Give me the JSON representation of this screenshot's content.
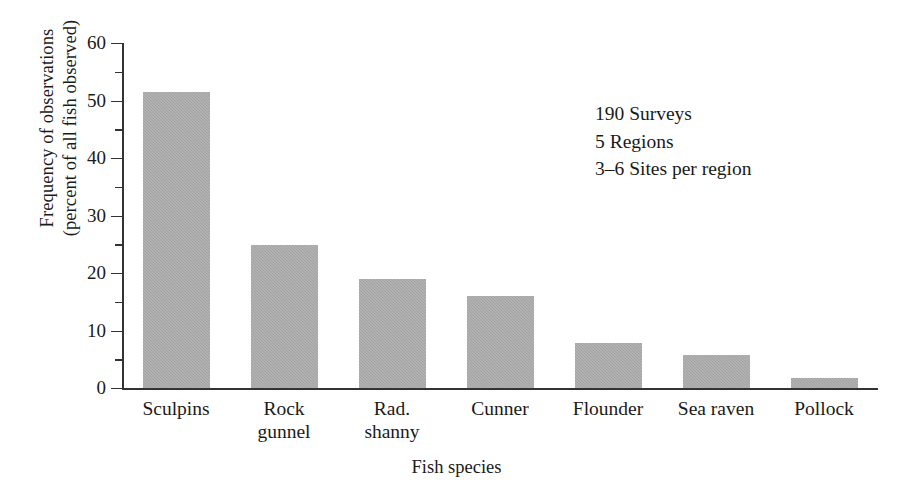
{
  "chart_data": {
    "type": "bar",
    "title": "",
    "xlabel": "Fish species",
    "ylabel_line1": "Frequency of observations",
    "ylabel_line2": "(percent of all fish observed)",
    "categories": [
      "Sculpins",
      "Rock gunnel",
      "Rad. shanny",
      "Cunner",
      "Flounder",
      "Sea raven",
      "Pollock"
    ],
    "category_lines": [
      [
        "Sculpins"
      ],
      [
        "Rock",
        "gunnel"
      ],
      [
        "Rad.",
        "shanny"
      ],
      [
        "Cunner"
      ],
      [
        "Flounder"
      ],
      [
        "Sea raven"
      ],
      [
        "Pollock"
      ]
    ],
    "values": [
      51.5,
      24.8,
      19.0,
      16.0,
      7.8,
      5.8,
      1.7
    ],
    "ylim": [
      0,
      60
    ],
    "ytick_major": [
      0,
      10,
      20,
      30,
      40,
      50,
      60
    ],
    "ytick_minor": [
      5,
      15,
      25,
      35,
      45,
      55
    ],
    "ytick_labels": [
      "0",
      "10",
      "20",
      "30",
      "40",
      "50",
      "60"
    ],
    "grid": false,
    "legend": "none",
    "bar_color": "#a2a2a2",
    "axis_color": "#333333",
    "annotations": [
      "190 Surveys",
      "5 Regions",
      "3–6 Sites per region"
    ]
  }
}
